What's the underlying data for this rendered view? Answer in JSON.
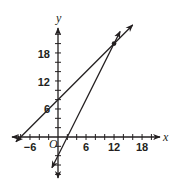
{
  "chart_data": {
    "type": "line",
    "title": "",
    "xlabel": "x",
    "ylabel": "y",
    "origin_label": "O",
    "xlim": [
      -9,
      21
    ],
    "ylim": [
      -7,
      24
    ],
    "x_tick_step": 2,
    "y_tick_step": 2,
    "x_tick_labels": [
      -6,
      6,
      12,
      18
    ],
    "y_tick_labels": [
      6,
      12,
      18
    ],
    "grid": false,
    "series": [
      {
        "name": "line-1",
        "equation": "y = x + 8",
        "slope": 1,
        "intercept": 8,
        "x_range": [
          -9,
          16
        ],
        "points": [
          [
            -8,
            0
          ],
          [
            0,
            8
          ],
          [
            12,
            20
          ]
        ]
      },
      {
        "name": "line-2",
        "equation": "y = 2x - 4",
        "slope": 2,
        "intercept": -4,
        "x_range": [
          -1.3,
          13.3
        ],
        "points": [
          [
            0,
            -4
          ],
          [
            2,
            0
          ],
          [
            12,
            20
          ]
        ]
      }
    ],
    "annotations": [
      {
        "type": "point",
        "x": 12,
        "y": 20,
        "label": "intersection"
      }
    ]
  },
  "labels": {
    "x_axis": "x",
    "y_axis": "y",
    "origin": "O",
    "x_ticks": [
      "−6",
      "6",
      "12",
      "18"
    ],
    "y_ticks": [
      "6",
      "12",
      "18"
    ]
  },
  "colors": {
    "ink": "#231f20",
    "background": "#ffffff"
  }
}
